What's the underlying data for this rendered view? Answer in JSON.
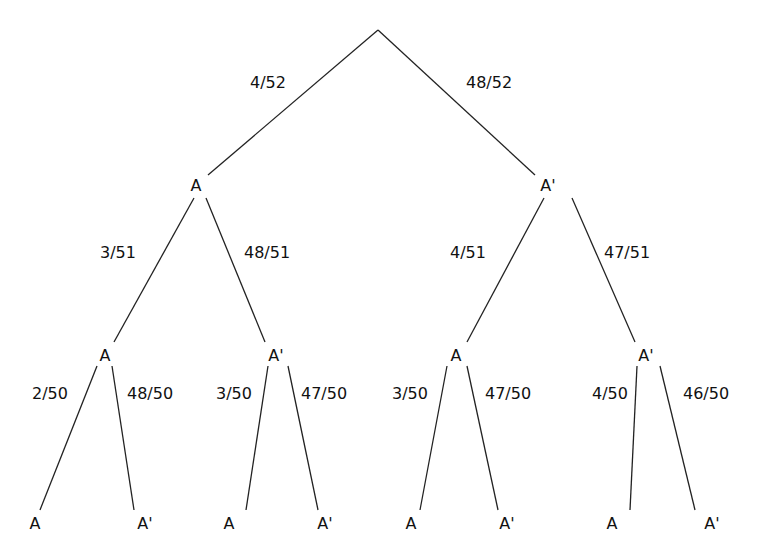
{
  "diagram": {
    "type": "probability-tree",
    "line_color": "#222222",
    "root": {
      "x": 378,
      "y": 30
    },
    "nodes": [
      {
        "id": "n1",
        "label": "A",
        "x": 196,
        "y": 186
      },
      {
        "id": "n2",
        "label": "A'",
        "x": 548,
        "y": 186
      },
      {
        "id": "n11",
        "label": "A",
        "x": 105,
        "y": 356
      },
      {
        "id": "n12",
        "label": "A'",
        "x": 276,
        "y": 356
      },
      {
        "id": "n21",
        "label": "A",
        "x": 456,
        "y": 356
      },
      {
        "id": "n22",
        "label": "A'",
        "x": 646,
        "y": 356
      },
      {
        "id": "l1",
        "label": "A",
        "x": 35,
        "y": 524
      },
      {
        "id": "l2",
        "label": "A'",
        "x": 145,
        "y": 524
      },
      {
        "id": "l3",
        "label": "A",
        "x": 229,
        "y": 524
      },
      {
        "id": "l4",
        "label": "A'",
        "x": 325,
        "y": 524
      },
      {
        "id": "l5",
        "label": "A",
        "x": 411,
        "y": 524
      },
      {
        "id": "l6",
        "label": "A'",
        "x": 507,
        "y": 524
      },
      {
        "id": "l7",
        "label": "A",
        "x": 612,
        "y": 524
      },
      {
        "id": "l8",
        "label": "A'",
        "x": 712,
        "y": 524
      }
    ],
    "edges": [
      {
        "x1": 378,
        "y1": 30,
        "x2": 208,
        "y2": 175,
        "prob": "4/52",
        "lx": 268,
        "ly": 83
      },
      {
        "x1": 378,
        "y1": 30,
        "x2": 535,
        "y2": 175,
        "prob": "48/52",
        "lx": 489,
        "ly": 83
      },
      {
        "x1": 194,
        "y1": 198,
        "x2": 114,
        "y2": 342,
        "prob": "3/51",
        "lx": 118,
        "ly": 253
      },
      {
        "x1": 206,
        "y1": 198,
        "x2": 265,
        "y2": 342,
        "prob": "48/51",
        "lx": 267,
        "ly": 253
      },
      {
        "x1": 544,
        "y1": 198,
        "x2": 467,
        "y2": 342,
        "prob": "4/51",
        "lx": 468,
        "ly": 253
      },
      {
        "x1": 572,
        "y1": 198,
        "x2": 635,
        "y2": 342,
        "prob": "47/51",
        "lx": 627,
        "ly": 253
      },
      {
        "x1": 97,
        "y1": 366,
        "x2": 40,
        "y2": 510,
        "prob": "2/50",
        "lx": 50,
        "ly": 394
      },
      {
        "x1": 112,
        "y1": 366,
        "x2": 134,
        "y2": 510,
        "prob": "48/50",
        "lx": 150,
        "ly": 394
      },
      {
        "x1": 268,
        "y1": 366,
        "x2": 246,
        "y2": 510,
        "prob": "3/50",
        "lx": 234,
        "ly": 394
      },
      {
        "x1": 288,
        "y1": 366,
        "x2": 318,
        "y2": 510,
        "prob": "47/50",
        "lx": 324,
        "ly": 394
      },
      {
        "x1": 447,
        "y1": 366,
        "x2": 420,
        "y2": 510,
        "prob": "3/50",
        "lx": 410,
        "ly": 394
      },
      {
        "x1": 467,
        "y1": 366,
        "x2": 498,
        "y2": 510,
        "prob": "47/50",
        "lx": 508,
        "ly": 394
      },
      {
        "x1": 637,
        "y1": 366,
        "x2": 630,
        "y2": 510,
        "prob": "4/50",
        "lx": 610,
        "ly": 394
      },
      {
        "x1": 660,
        "y1": 366,
        "x2": 695,
        "y2": 510,
        "prob": "46/50",
        "lx": 706,
        "ly": 394
      }
    ]
  }
}
